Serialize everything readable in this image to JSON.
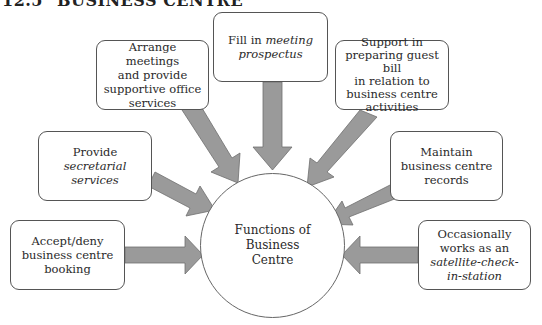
{
  "title": {
    "number": "12.5",
    "text": "BUSINESS CENTRE"
  },
  "center": {
    "lines": [
      "Functions of",
      "Business",
      "Centre"
    ]
  },
  "boxes": {
    "arrange": {
      "lines": [
        "Arrange meetings",
        "and provide",
        "supportive office",
        "services"
      ]
    },
    "prospectus": {
      "plain": "Fill in ",
      "italic1": "meeting",
      "italic2": "prospectus"
    },
    "guest_bill": {
      "lines": [
        "Support in",
        "preparing guest bill",
        "in relation to",
        "business centre",
        "activities"
      ]
    },
    "secretarial": {
      "plain": "Provide",
      "italic1": "secretarial",
      "italic2": "services"
    },
    "records": {
      "lines": [
        "Maintain",
        "business centre",
        "records"
      ]
    },
    "booking": {
      "lines": [
        "Accept/deny",
        "business centre",
        "booking"
      ]
    },
    "satellite": {
      "line1": "Occasionally",
      "line2": "works as an",
      "italic1": "satellite-check-",
      "italic2": "in-station"
    }
  },
  "colors": {
    "arrow_fill": "#9a9a9a",
    "arrow_stroke": "#6e6e6e",
    "border": "#555555"
  }
}
